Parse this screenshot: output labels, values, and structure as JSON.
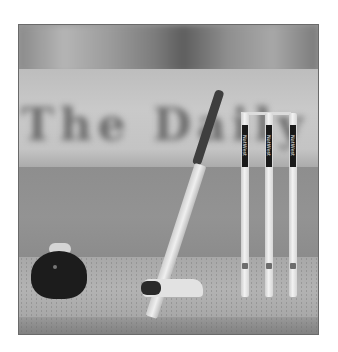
{
  "image": {
    "description": "Grayscale photo of cricket equipment: a helmet, batting gloves, a bat leaning against three stumps with bails, blurred stadium banner in background",
    "banner_text": "The Daily",
    "stump_sponsor": "NatWest",
    "stumps": [
      {
        "label": "NatWest"
      },
      {
        "label": "NatWest"
      },
      {
        "label": "NatWest"
      }
    ],
    "colors": {
      "border": "#6a6a6a",
      "helmet": "#1c1c1c",
      "bat_handle": "#3e3e3e",
      "stump": "#f2f2f2",
      "pitch": "#b3b3b3",
      "outfield": "#8e8e8e",
      "banner": "#c9c9c9"
    }
  }
}
